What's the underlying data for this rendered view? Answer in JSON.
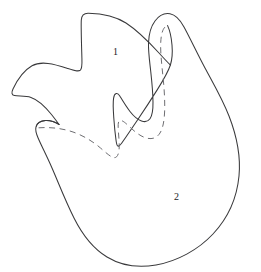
{
  "figure": {
    "type": "line-drawing",
    "canvas": {
      "width": 261,
      "height": 272
    },
    "colors": {
      "background": "#ffffff",
      "outline_stroke": "#3a3a3c",
      "hidden_stroke": "#6e6e72",
      "label_text": "#1b1b1d"
    },
    "regions": [
      {
        "id": "region-1",
        "label": "1",
        "description": "upper lobed region",
        "label_x": 113,
        "label_y": 47
      },
      {
        "id": "region-2",
        "label": "2",
        "description": "lower bulbous region",
        "label_x": 174,
        "label_y": 192
      }
    ],
    "strokes": {
      "outline_style": "solid",
      "hidden_contour_style": "dashed",
      "hidden_contour_note": "dashed line indicates obscured / internal boundary"
    }
  }
}
